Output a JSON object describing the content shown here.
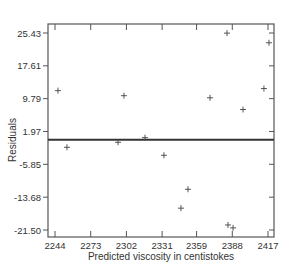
{
  "chart_data": {
    "type": "scatter",
    "title": "",
    "xlabel": "Predicted viscosity in centistokes",
    "ylabel": "Residuals",
    "xlim": [
      2244,
      2417
    ],
    "ylim": [
      -21.5,
      25.43
    ],
    "x_ticks": [
      2244,
      2273,
      2302,
      2331,
      2359,
      2388,
      2417
    ],
    "x_tick_labels": [
      "2244",
      "2273",
      "2302",
      "2331",
      "2359",
      "2388",
      "2417"
    ],
    "y_ticks": [
      25.43,
      17.61,
      9.79,
      1.97,
      -5.85,
      -13.68,
      -21.5
    ],
    "y_tick_labels": [
      "25.43",
      "17.61",
      "9.79",
      "1.97",
      "-5.85",
      "-13.68",
      "-21.50"
    ],
    "grid": false,
    "legend": null,
    "marker": "+",
    "reference_line": {
      "y": 0,
      "style": "solid",
      "weight": "heavy"
    },
    "series": [
      {
        "name": "Residuals",
        "points": [
          {
            "x": 2246.4,
            "y": 11.7
          },
          {
            "x": 2253.7,
            "y": -1.8
          },
          {
            "x": 2295.2,
            "y": -0.6
          },
          {
            "x": 2300.0,
            "y": 10.5
          },
          {
            "x": 2317.1,
            "y": 0.5
          },
          {
            "x": 2332.5,
            "y": -3.7
          },
          {
            "x": 2346.3,
            "y": -16.3
          },
          {
            "x": 2352.0,
            "y": -11.8
          },
          {
            "x": 2369.9,
            "y": 10.0
          },
          {
            "x": 2383.7,
            "y": 25.4
          },
          {
            "x": 2384.5,
            "y": -20.3
          },
          {
            "x": 2388.6,
            "y": -21.0
          },
          {
            "x": 2396.7,
            "y": 7.2
          },
          {
            "x": 2413.7,
            "y": 12.2
          },
          {
            "x": 2417.8,
            "y": 23.1
          }
        ]
      }
    ]
  }
}
